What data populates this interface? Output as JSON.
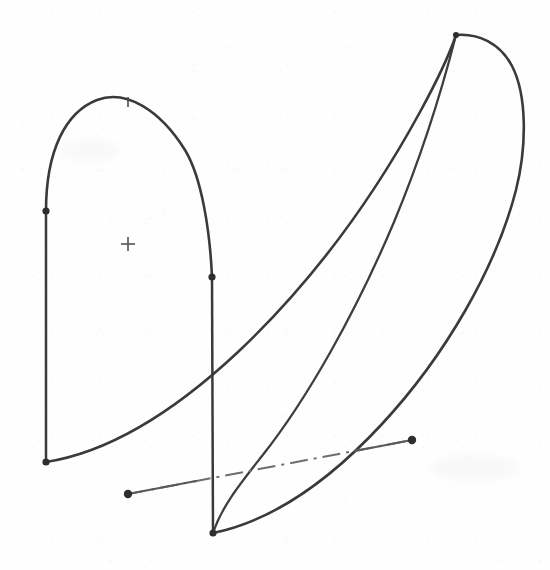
{
  "figure": {
    "kind": "engineering-line-drawing",
    "background_color": "#fefefe",
    "ink_color": "#3a3a3c",
    "centerline_color": "#6e6e70",
    "width": 550,
    "height": 570
  },
  "geometry": {
    "left_section": {
      "name": "left-profile",
      "arch_path": "M 46 211 C 46 150 66 112 97 100 C 126 89 160 110 185 150 C 202 178 210 232 212 277",
      "left_stacking_line": {
        "x1": 46,
        "y1": 211,
        "x2": 46,
        "y2": 462
      },
      "right_stacking_line": {
        "x1": 212,
        "y1": 277,
        "x2": 213,
        "y2": 533
      },
      "inner_base_curve": "M 46 462 C 110 452 176 410 238 352 C 310 284 372 200 420 112 C 438 79 450 53 456 35"
    },
    "right_section": {
      "name": "right-profile",
      "outer_curve": "M 213 533 C 272 521 330 480 382 424 C 445 356 496 268 516 190 C 527 146 527 95 512 66 C 500 43 478 33 456 35",
      "mid_curve": "M 456 35 C 444 82 424 150 394 222 C 356 312 308 398 262 456 C 240 484 222 506 213 533",
      "apex_point": {
        "x": 456,
        "y": 35
      }
    },
    "centerline": {
      "name": "reference-centerline",
      "style": "dash-dot",
      "x1": 128,
      "y1": 494,
      "x2": 412,
      "y2": 440,
      "dash_pattern": "18 6 3 6"
    },
    "leader_segments": [
      {
        "name": "leader-left",
        "x1": 128,
        "y1": 494,
        "x2": 196,
        "y2": 481
      },
      {
        "name": "leader-right",
        "x1": 355,
        "y1": 451,
        "x2": 412,
        "y2": 440
      }
    ],
    "node_dots": [
      {
        "name": "node-left-upper",
        "x": 46,
        "y": 211,
        "r": 3.6
      },
      {
        "name": "node-left-lower",
        "x": 46,
        "y": 462,
        "r": 3.6
      },
      {
        "name": "node-mid-upper",
        "x": 212,
        "y": 277,
        "r": 3.6
      },
      {
        "name": "node-mid-lower",
        "x": 213,
        "y": 533,
        "r": 3.6
      },
      {
        "name": "node-centerline-left",
        "x": 128,
        "y": 494,
        "r": 4.2
      },
      {
        "name": "node-centerline-right",
        "x": 412,
        "y": 440,
        "r": 4.2
      },
      {
        "name": "node-apex-right",
        "x": 456,
        "y": 35,
        "r": 3.0
      }
    ],
    "crosshairs": [
      {
        "name": "datum-center",
        "x": 128,
        "y": 244,
        "arm": 7
      }
    ],
    "ticks": [
      {
        "name": "apex-tick-left-profile",
        "x": 128,
        "y": 102,
        "length": 9
      }
    ]
  }
}
